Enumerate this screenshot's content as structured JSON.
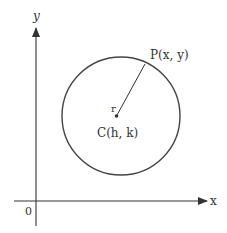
{
  "diagram": {
    "type": "circle-in-coordinate-plane",
    "axes": {
      "x_label": "x",
      "y_label": "y",
      "origin_label": "0"
    },
    "circle": {
      "center_label": "C(h, k)",
      "radius_label": "r",
      "point_label": "P(x, y)"
    },
    "colors": {
      "stroke": "#333333",
      "background": "#ffffff"
    }
  }
}
